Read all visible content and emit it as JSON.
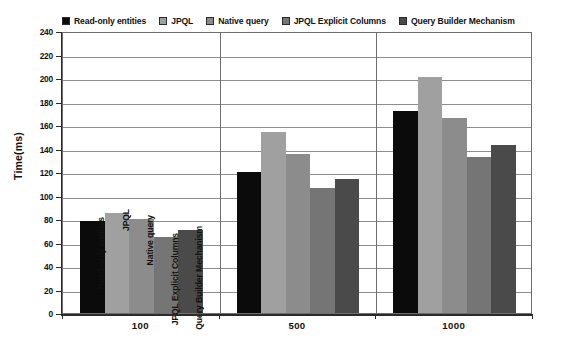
{
  "chart_data": {
    "type": "bar",
    "title": "",
    "xlabel": "",
    "ylabel": "Time(ms)",
    "categories": [
      "100",
      "500",
      "1000"
    ],
    "ylim": [
      0,
      240
    ],
    "ytick_step": 20,
    "yticks": [
      "0",
      "20",
      "40",
      "60",
      "80",
      "100",
      "120",
      "140",
      "160",
      "180",
      "200",
      "220",
      "240"
    ],
    "grid": true,
    "legend_position": "top",
    "series": [
      {
        "name": "Read-only entities",
        "color": "#0b0b0b",
        "values": [
          78,
          120,
          172
        ]
      },
      {
        "name": "JPQL",
        "color": "#a0a0a0",
        "values": [
          85,
          154,
          201
        ]
      },
      {
        "name": "Native query",
        "color": "#8c8c8c",
        "values": [
          80,
          135,
          166
        ]
      },
      {
        "name": "JPQL Explicit Columns",
        "color": "#757575",
        "values": [
          65,
          106,
          133
        ]
      },
      {
        "name": "Query Builder Mechanism",
        "color": "#4a4a4a",
        "values": [
          71,
          114,
          143
        ]
      }
    ],
    "inline_group_labels": [
      "Read-only entities",
      "JPQL",
      "Native query",
      "JPQL Explicit Columns",
      "Query Builder Mechanism"
    ]
  }
}
